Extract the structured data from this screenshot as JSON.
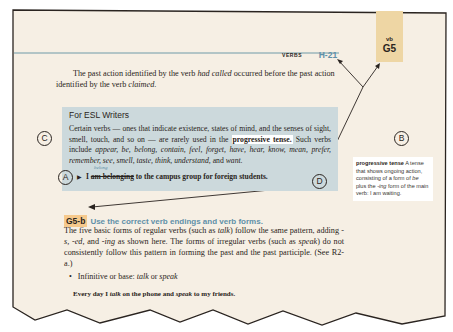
{
  "page": {
    "running_head": {
      "section": "VERBS",
      "page_number": "H-21"
    },
    "tab": {
      "sub": "vb",
      "code": "G5"
    },
    "intro_paragraph": {
      "t1": "The past action identified by the verb ",
      "i1": "had called",
      "t2": " occurred before the past action identified by the verb ",
      "i2": "claimed",
      "t3": "."
    },
    "esl_box": {
      "title": "For ESL Writers",
      "t1": "Certain verbs — ones that indicate existence, states of mind, and the senses of sight, smell, touch, and so on — are rarely used in the ",
      "highlight": "progressive tense.",
      "t2": " Such verbs include ",
      "verbs": "appear, be, belong, contain, feel, forget, have, hear, know, mean, prefer, remember, see, smell, taste, think, understand,",
      "t3": " and ",
      "last": "want",
      "t4": ".",
      "correction": "belong",
      "example_arrow": "▶",
      "example_start": "I ",
      "example_struck": "am belonging",
      "example_end": " to the campus group for foreign students."
    },
    "glossary": {
      "term": "progressive tense",
      "definition": " A tense that shows ongoing action, consisting of a form of ",
      "be": "be",
      "def2": " plus the ",
      "ing": "-ing",
      "def3": " form of the main verb: I am waiting."
    },
    "section": {
      "code": "G5-b",
      "title": "Use the correct verb endings and verb forms.",
      "paragraph": {
        "t1": "The five basic forms of regular verbs (such as ",
        "i1": "talk",
        "t2": ") follow the same pattern, adding ",
        "i2": "-s, -ed,",
        "t3": " and ",
        "i3": "-ing",
        "t4": " as shown here. The forms of irregular verbs (such as ",
        "i4": "speak",
        "t5": ") do not consistently follow this pattern in forming the past and the past participle. (See R2-a.)"
      },
      "bullet": {
        "dot": "•",
        "label": "Infinitive or base: ",
        "i1": "talk",
        "or": " or ",
        "i2": "speak"
      },
      "example": {
        "t1": "Every day I ",
        "i1": "talk",
        "t2": " on the phone and ",
        "i2": "speak",
        "t3": " to my friends."
      }
    }
  },
  "callouts": {
    "a": "A",
    "b": "B",
    "c": "C",
    "d": "D"
  },
  "colors": {
    "paper": "#f6efe4",
    "accent_blue": "#5f8fa8",
    "tab": "#eed6a4",
    "esl_box": "#ccd9dc",
    "section_code_bg": "#f6c98c"
  }
}
